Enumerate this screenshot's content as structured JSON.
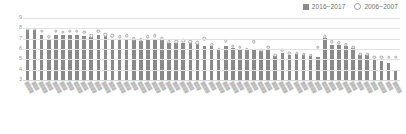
{
  "legend": {
    "position": "top-right",
    "entries": [
      {
        "label": "2016~2017",
        "marker": "filled-square",
        "color": "#8c8c8c"
      },
      {
        "label": "2006~2007",
        "marker": "open-circle",
        "color": "#9a9a9a"
      }
    ]
  },
  "chart_data": {
    "type": "bar",
    "title": "",
    "subtitle": "",
    "xlabel": "",
    "ylabel": "",
    "ylim": [
      3,
      9
    ],
    "yticks": [
      9,
      8,
      7,
      6,
      5,
      4,
      3
    ],
    "grid": true,
    "legend_position": "top-right",
    "annotations": [],
    "note": "Labels on the x-axis are rotated CJK text rendered too small to resolve; rendered as illegible placeholder glyph strings.",
    "categories": [
      "▓▓▓▓",
      "▓▓▓",
      "▓▓▓▓",
      "▓▓▓",
      "▓▓▓▓",
      "▓▓▓",
      "▓▓▓",
      "▓▓▓▓",
      "▓▓▓",
      "▓▓▓▓",
      "▓▓▓",
      "▓▓▓▓",
      "▓▓▓",
      "▓▓▓▓",
      "▓▓▓",
      "▓▓▓",
      "▓▓▓▓",
      "▓▓▓",
      "▓▓▓▓",
      "▓▓▓",
      "▓▓▓▓",
      "▓▓▓",
      "▓▓▓▓",
      "▓▓▓",
      "▓▓▓",
      "▓▓▓▓",
      "▓▓▓",
      "▓▓▓▓",
      "▓▓▓",
      "▓▓▓▓",
      "▓▓▓",
      "▓▓▓▓",
      "▓▓▓",
      "▓▓▓▓",
      "▓▓▓",
      "▓▓▓",
      "▓▓▓▓",
      "▓▓▓",
      "▓▓▓▓",
      "▓▓▓",
      "▓▓▓▓",
      "▓▓▓",
      "▓▓▓▓",
      "▓▓▓",
      "▓▓▓",
      "▓▓▓▓",
      "▓▓▓",
      "▓▓▓"
    ],
    "series": [
      {
        "name": "2016~2017",
        "marker": "bar",
        "color": "#8a8a8a",
        "values": [
          7.8,
          7.8,
          7.4,
          7.0,
          7.4,
          7.4,
          7.4,
          7.4,
          7.3,
          7.2,
          7.4,
          7.4,
          7.0,
          7.0,
          7.0,
          6.9,
          6.8,
          6.9,
          6.9,
          6.9,
          6.6,
          6.6,
          6.6,
          6.6,
          6.6,
          6.3,
          6.3,
          5.9,
          6.3,
          6.1,
          6.0,
          5.9,
          6.0,
          5.8,
          6.0,
          5.3,
          5.6,
          5.4,
          5.5,
          5.4,
          5.3,
          5.2,
          7.1,
          6.4,
          6.4,
          6.3,
          6.1,
          5.4
        ]
      },
      {
        "name": "2006~2007",
        "marker": "open-circle",
        "color": "#a8a8a8",
        "values": [
          7.9,
          7.9,
          7.7,
          7.2,
          7.7,
          7.6,
          7.7,
          7.7,
          7.6,
          7.3,
          7.7,
          7.4,
          7.3,
          7.2,
          7.3,
          7.0,
          6.9,
          7.2,
          7.3,
          7.0,
          6.7,
          6.7,
          6.8,
          6.7,
          6.6,
          7.0,
          6.4,
          6.0,
          6.8,
          6.3,
          6.2,
          6.0,
          6.7,
          5.9,
          6.2,
          5.4,
          5.9,
          5.6,
          5.6,
          5.5,
          5.4,
          6.2,
          7.2,
          6.7,
          6.6,
          6.4,
          6.2,
          5.5
        ]
      }
    ],
    "tail_values": {
      "note": "final bars decline toward 4",
      "bars": [
        5.4,
        5.0,
        4.8,
        4.6,
        4.0
      ],
      "markers": [
        5.5,
        5.2,
        5.2,
        5.2,
        5.2
      ]
    }
  }
}
